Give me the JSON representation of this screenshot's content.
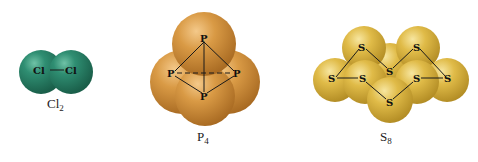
{
  "figure": {
    "molecules": [
      {
        "id": "cl2",
        "caption": {
          "base": "Cl",
          "subscript": "2"
        },
        "atom_symbol": "Cl",
        "atom_count": 2,
        "color": "#2b8a6e",
        "atoms": [
          {
            "label": "Cl",
            "x": 44,
            "y": 73
          },
          {
            "label": "Cl",
            "x": 71,
            "y": 73
          }
        ],
        "bonds": [
          [
            0,
            1
          ]
        ]
      },
      {
        "id": "p4",
        "caption": {
          "base": "P",
          "subscript": "4"
        },
        "atom_symbol": "P",
        "atom_count": 4,
        "color": "#d69a45",
        "atoms": [
          {
            "label": "P",
            "x": 204,
            "y": 40
          },
          {
            "label": "P",
            "x": 172,
            "y": 74
          },
          {
            "label": "P",
            "x": 237,
            "y": 74
          },
          {
            "label": "P",
            "x": 204,
            "y": 97
          }
        ],
        "bonds": [
          [
            0,
            1
          ],
          [
            0,
            2
          ],
          [
            0,
            3
          ],
          [
            1,
            3
          ],
          [
            2,
            3
          ]
        ],
        "dashed_bonds": [
          [
            1,
            2
          ]
        ]
      },
      {
        "id": "s8",
        "caption": {
          "base": "S",
          "subscript": "8"
        },
        "atom_symbol": "S",
        "atom_count": 8,
        "color": "#e2be4a",
        "atoms": [
          {
            "label": "S",
            "x": 362,
            "y": 47
          },
          {
            "label": "S",
            "x": 417,
            "y": 47
          },
          {
            "label": "S",
            "x": 390,
            "y": 71
          },
          {
            "label": "S",
            "x": 332,
            "y": 81
          },
          {
            "label": "S",
            "x": 362,
            "y": 81
          },
          {
            "label": "S",
            "x": 417,
            "y": 81
          },
          {
            "label": "S",
            "x": 448,
            "y": 81
          },
          {
            "label": "S",
            "x": 390,
            "y": 103
          }
        ],
        "bonds": [
          [
            3,
            0
          ],
          [
            0,
            2
          ],
          [
            2,
            1
          ],
          [
            1,
            6
          ],
          [
            6,
            5
          ],
          [
            5,
            7
          ],
          [
            7,
            4
          ],
          [
            4,
            3
          ]
        ]
      }
    ]
  }
}
